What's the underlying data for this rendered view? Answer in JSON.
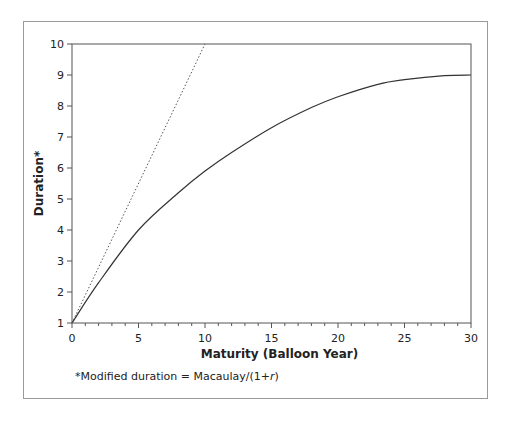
{
  "chart_data": {
    "type": "line",
    "title": "",
    "xlabel": "Maturity (Balloon Year)",
    "ylabel": "Duration*",
    "xlim": [
      0,
      30
    ],
    "ylim": [
      1,
      10
    ],
    "x_ticks": [
      "0",
      "5",
      "10",
      "15",
      "20",
      "25",
      "30"
    ],
    "y_ticks": [
      "1",
      "2",
      "3",
      "4",
      "5",
      "6",
      "7",
      "8",
      "9",
      "10"
    ],
    "grid": false,
    "legend": null,
    "series": [
      {
        "name": "Modified duration (curve)",
        "style": "solid",
        "x": [
          0,
          2,
          5,
          8,
          10,
          12,
          15,
          18,
          20,
          23,
          25,
          28,
          30
        ],
        "values": [
          1.0,
          2.3,
          4.0,
          5.2,
          5.9,
          6.5,
          7.3,
          7.95,
          8.3,
          8.7,
          8.85,
          8.98,
          9.0
        ]
      },
      {
        "name": "Reference line",
        "style": "dotted",
        "x": [
          0,
          10
        ],
        "values": [
          1.0,
          10.0
        ]
      }
    ],
    "annotations": [
      "*Modified duration = Macaulay/(1+r)"
    ]
  },
  "footnote": {
    "prefix": "*Modified duration = Macaulay/(1+",
    "var": "r",
    "suffix": ")"
  }
}
